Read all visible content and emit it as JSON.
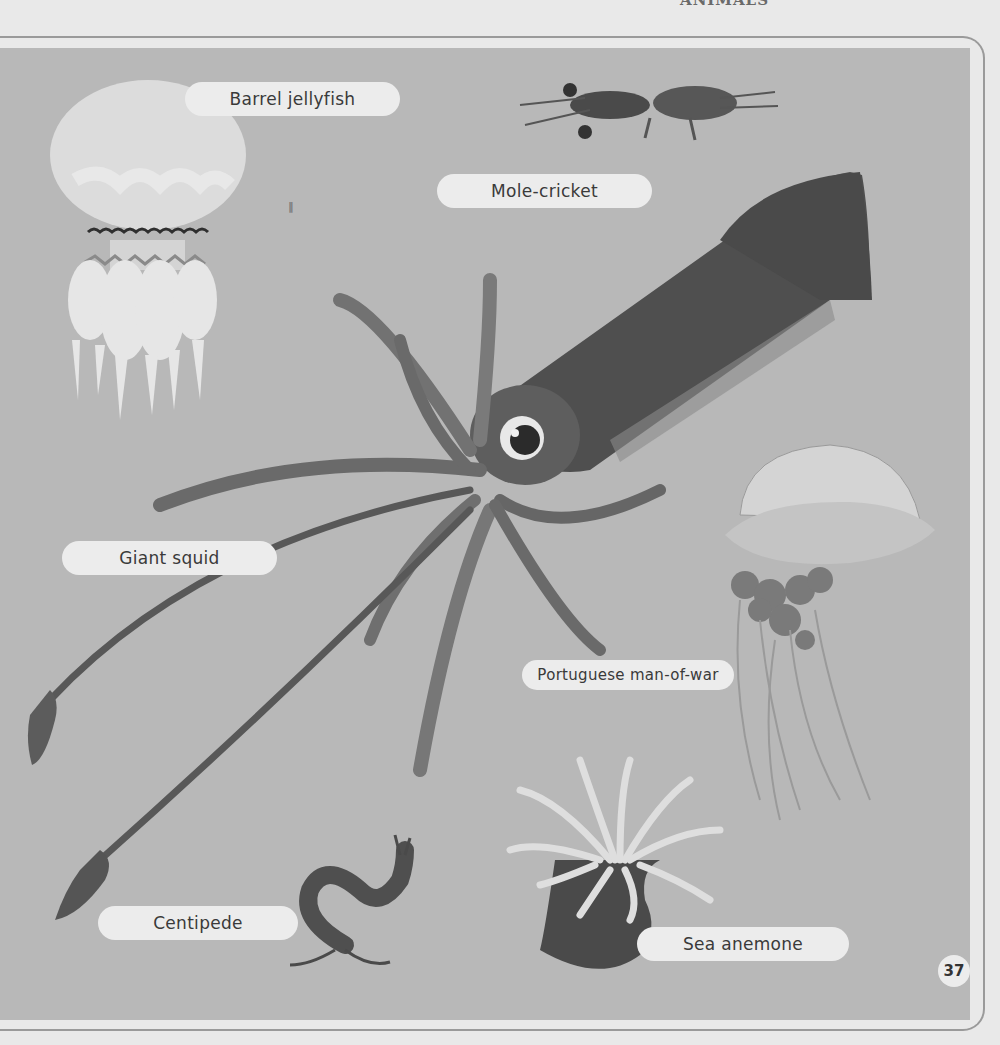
{
  "page": {
    "header_clipped_text": "ANIMALS",
    "page_number": "37",
    "colors": {
      "page_bg": "#e9e9e9",
      "panel_bg": "#b8b8b8",
      "label_bg": "#ececec",
      "label_text": "#3a3a3a",
      "frame_line": "#9a9a9a"
    }
  },
  "labels": {
    "barrel_jellyfish": "Barrel jellyfish",
    "mole_cricket": "Mole-cricket",
    "giant_squid": "Giant squid",
    "portuguese_man_of_war": "Portuguese man-of-war",
    "centipede": "Centipede",
    "sea_anemone": "Sea anemone"
  },
  "illustrations": [
    {
      "name": "barrel-jellyfish",
      "label": "Barrel jellyfish"
    },
    {
      "name": "mole-cricket",
      "label": "Mole-cricket"
    },
    {
      "name": "giant-squid",
      "label": "Giant squid"
    },
    {
      "name": "portuguese-man-of-war",
      "label": "Portuguese man-of-war"
    },
    {
      "name": "centipede",
      "label": "Centipede"
    },
    {
      "name": "sea-anemone",
      "label": "Sea anemone"
    }
  ]
}
